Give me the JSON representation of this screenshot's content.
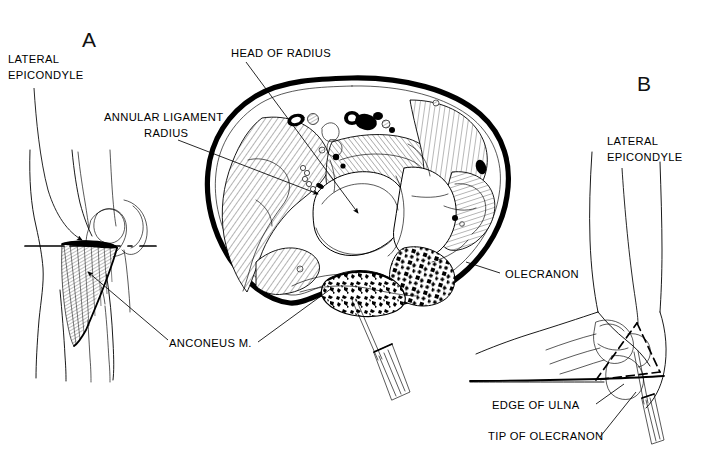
{
  "figure": {
    "title_visible": "",
    "background_color": "#ffffff",
    "ink_color": "#000000",
    "panels": [
      {
        "id": "A",
        "letter": "A",
        "description": "lateral view of elbow showing anconeus muscle and cross-section level line"
      },
      {
        "id": "B",
        "letter": "B",
        "description": "posterolateral view of elbow with needle and bony landmark triangle"
      }
    ],
    "center": {
      "description": "axial cross-section of the elbow at the level of the radial head"
    }
  },
  "labels": {
    "panelA_letter": "A",
    "panelB_letter": "B",
    "lateral_epicondyle_a_line1": "LATERAL",
    "lateral_epicondyle_a_line2": "EPICONDYLE",
    "head_of_radius": "HEAD OF RADIUS",
    "annular_ligament": "ANNULAR  LIGAMENT",
    "radius": "RADIUS",
    "anconeus": "ANCONEUS  M.",
    "olecranon": "OLECRANON",
    "lateral_epicondyle_b_line1": "LATERAL",
    "lateral_epicondyle_b_line2": "EPICONDYLE",
    "edge_of_ulna": "EDGE OF  ULNA",
    "tip_of_olecranon": "TIP OF OLECRANON"
  },
  "colors": {
    "ink": "#000000",
    "paper": "#ffffff",
    "hatch": "#000000"
  }
}
